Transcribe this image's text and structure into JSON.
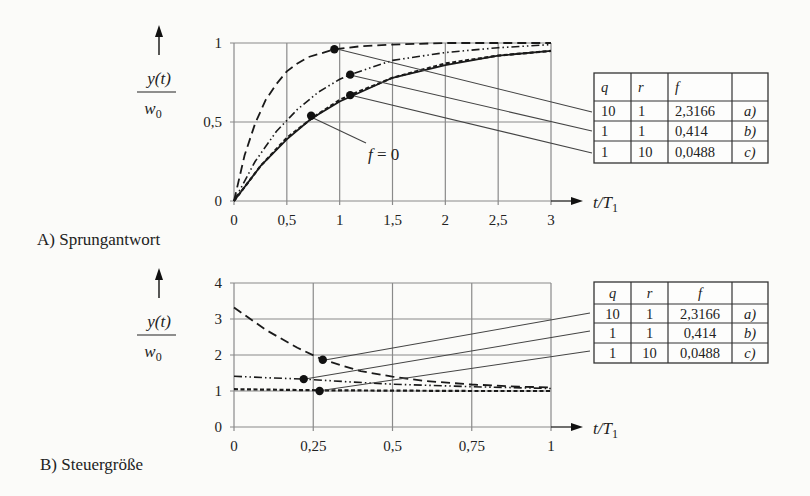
{
  "figure": {
    "panel_a_caption": "A) Sprungantwort",
    "panel_b_caption": "B) Steuergröße"
  },
  "chart_data": [
    {
      "id": "A",
      "type": "line",
      "title": "A) Sprungantwort",
      "xlabel": "t/T1",
      "ylabel": "y(t)/w0",
      "xlim": [
        0,
        3
      ],
      "ylim": [
        0,
        1
      ],
      "x_ticks": [
        "0",
        "0,5",
        "1",
        "1,5",
        "2",
        "2,5",
        "3"
      ],
      "y_ticks": [
        "0",
        "0,5",
        "1"
      ],
      "grid": true,
      "annotation": "f = 0",
      "series": [
        {
          "name": "a)",
          "style": "long-dash",
          "marker": {
            "x": 0.95,
            "y": 0.96
          },
          "x": [
            0,
            0.1,
            0.2,
            0.3,
            0.4,
            0.5,
            0.6,
            0.7,
            0.8,
            0.95,
            1.2,
            1.5,
            2,
            2.5,
            3
          ],
          "y": [
            0,
            0.29,
            0.49,
            0.64,
            0.74,
            0.82,
            0.87,
            0.91,
            0.93,
            0.96,
            0.98,
            0.99,
            1.0,
            1.0,
            1.0
          ]
        },
        {
          "name": "b)",
          "style": "dash-dot-dot",
          "marker": {
            "x": 1.1,
            "y": 0.8
          },
          "x": [
            0,
            0.2,
            0.4,
            0.6,
            0.8,
            1.0,
            1.1,
            1.5,
            2,
            2.5,
            3
          ],
          "y": [
            0,
            0.25,
            0.44,
            0.58,
            0.69,
            0.77,
            0.8,
            0.89,
            0.94,
            0.97,
            0.99
          ]
        },
        {
          "name": "c)",
          "style": "short-dash",
          "marker": {
            "x": 1.1,
            "y": 0.67
          },
          "x": [
            0,
            0.25,
            0.5,
            0.75,
            1.0,
            1.1,
            1.5,
            2,
            2.5,
            3
          ],
          "y": [
            0,
            0.22,
            0.4,
            0.53,
            0.64,
            0.67,
            0.78,
            0.87,
            0.92,
            0.95
          ]
        },
        {
          "name": "f = 0",
          "style": "solid",
          "marker": {
            "x": 0.73,
            "y": 0.54
          },
          "x": [
            0,
            0.25,
            0.5,
            0.73,
            1.0,
            1.5,
            2,
            2.5,
            3
          ],
          "y": [
            0,
            0.22,
            0.39,
            0.52,
            0.63,
            0.78,
            0.86,
            0.92,
            0.95
          ]
        }
      ],
      "table": {
        "headers": [
          "q",
          "r",
          "f",
          ""
        ],
        "rows": [
          [
            "10",
            "1",
            "2,3166",
            "a)"
          ],
          [
            "1",
            "1",
            "0,414",
            "b)"
          ],
          [
            "1",
            "10",
            "0,0488",
            "c)"
          ]
        ]
      }
    },
    {
      "id": "B",
      "type": "line",
      "title": "B) Steuergröße",
      "xlabel": "t/T1",
      "ylabel": "y(t)/w0",
      "xlim": [
        0,
        1
      ],
      "ylim": [
        0,
        4
      ],
      "x_ticks": [
        "0",
        "0,25",
        "0,5",
        "0,75",
        "1"
      ],
      "y_ticks": [
        "0",
        "1",
        "2",
        "3",
        "4"
      ],
      "grid": true,
      "series": [
        {
          "name": "a)",
          "style": "long-dash",
          "marker": {
            "x": 0.28,
            "y": 1.87
          },
          "x": [
            0,
            0.1,
            0.2,
            0.28,
            0.4,
            0.5,
            0.6,
            0.75,
            0.9,
            1.0
          ],
          "y": [
            3.32,
            2.7,
            2.2,
            1.87,
            1.55,
            1.4,
            1.28,
            1.18,
            1.12,
            1.1
          ]
        },
        {
          "name": "b)",
          "style": "dash-dot-dot",
          "marker": {
            "x": 0.22,
            "y": 1.33
          },
          "x": [
            0,
            0.1,
            0.22,
            0.35,
            0.5,
            0.75,
            1.0
          ],
          "y": [
            1.41,
            1.37,
            1.33,
            1.26,
            1.19,
            1.12,
            1.07
          ]
        },
        {
          "name": "c)",
          "style": "short-dash",
          "marker": {
            "x": 0.27,
            "y": 1.0
          },
          "x": [
            0,
            0.27,
            0.5,
            0.75,
            1.0
          ],
          "y": [
            1.05,
            1.02,
            1.01,
            1.0,
            1.0
          ]
        }
      ],
      "table": {
        "headers": [
          "q",
          "r",
          "f",
          ""
        ],
        "rows": [
          [
            "10",
            "1",
            "2,3166",
            "a)"
          ],
          [
            "1",
            "1",
            "0,414",
            "b)"
          ],
          [
            "1",
            "10",
            "0,0488",
            "c)"
          ]
        ]
      }
    }
  ],
  "labels": {
    "ylabel_num": "y(t)",
    "ylabel_den_w": "w",
    "ylabel_den_sub": "0",
    "xlabel_t": "t/T",
    "xlabel_sub": "1",
    "f0": "f = 0"
  }
}
